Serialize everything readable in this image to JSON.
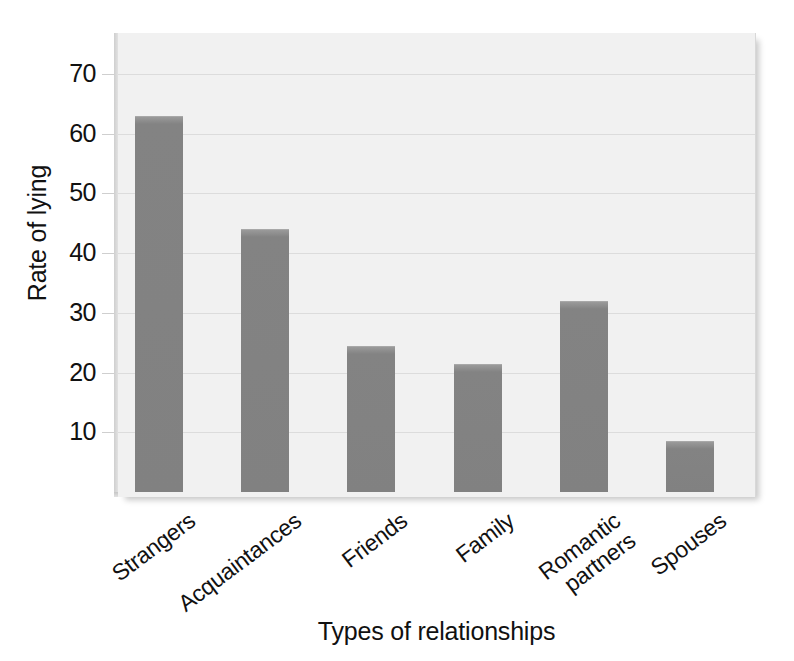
{
  "chart_data": {
    "type": "bar",
    "title": "",
    "subtitle": "",
    "xlabel": "Types of relationships",
    "ylabel": "Rate of lying",
    "categories": [
      "Strangers",
      "Acquaintances",
      "Friends",
      "Family",
      "Romantic partners",
      "Spouses"
    ],
    "values": [
      63,
      44,
      24.5,
      21.5,
      32,
      8.5
    ],
    "yticks": [
      10,
      20,
      30,
      40,
      50,
      60,
      70
    ],
    "ytick_labels": [
      "10",
      "20",
      "30",
      "40",
      "50",
      "60",
      "70"
    ],
    "ylim": [
      0,
      77
    ],
    "xlim_categories": 6,
    "grid": "horizontal",
    "legend": "none",
    "annotations": [],
    "colors": {
      "bar_fill": "#848484",
      "bar_top_edge": "#a8a8a8",
      "plot_background": "#f1f1f1",
      "gridline": "#dcdcdc",
      "axis_spine": "#cfcfcf",
      "text": "#111111",
      "page_background": "#ffffff"
    }
  }
}
